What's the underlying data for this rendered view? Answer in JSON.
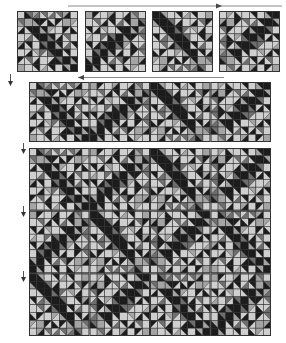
{
  "figure": {
    "colors": {
      "black": "#1c1c1c",
      "dark_gray": "#6e6e6e",
      "mid_gray": "#a4a4a4",
      "light_gray": "#cfcfcf",
      "grid_line": "#2a2a2a",
      "arrow": "#444444"
    },
    "block_grid": 8,
    "base_block": [
      [
        "L",
        "DB",
        "MD",
        "DL",
        "LD",
        "DL",
        "MB",
        "L"
      ],
      [
        "DM",
        "M",
        "BM",
        "BL",
        "LB",
        "BL",
        "M",
        "ML"
      ],
      [
        "LB",
        "BL",
        "B",
        "BM",
        "ML",
        "L",
        "BL",
        "LB"
      ],
      [
        "L",
        "LD",
        "BL",
        "B",
        "BD",
        "LB",
        "DL",
        "L"
      ],
      [
        "MB",
        "BL",
        "L",
        "DB",
        "B",
        "BM",
        "LD",
        "BL"
      ],
      [
        "L",
        "LB",
        "ML",
        "DL",
        "BD",
        "B",
        "BL",
        "L"
      ],
      [
        "BL",
        "DL",
        "LB",
        "L",
        "LB",
        "DB",
        "B",
        "BM"
      ],
      [
        "M",
        "L",
        "BL",
        "LM",
        "BL",
        "L",
        "MB",
        "B"
      ]
    ],
    "top_row": {
      "label": "four rotated blocks",
      "blocks": [
        {
          "id": "block-1",
          "rotation": 0
        },
        {
          "id": "block-2",
          "rotation": 90
        },
        {
          "id": "block-3",
          "rotation": 180
        },
        {
          "id": "block-4",
          "rotation": 270
        }
      ]
    },
    "strip": {
      "label": "joined block strip",
      "cols": 4,
      "rows": 1
    },
    "quilt": {
      "label": "assembled quilt top",
      "cols": 4,
      "rows": 3
    },
    "arrows": [
      {
        "id": "arrow-top-right",
        "direction": "right"
      },
      {
        "id": "arrow-return-left",
        "direction": "left"
      },
      {
        "id": "arrow-down-1",
        "direction": "down"
      },
      {
        "id": "arrow-down-2",
        "direction": "down"
      },
      {
        "id": "arrow-down-3",
        "direction": "down"
      },
      {
        "id": "arrow-down-4",
        "direction": "down"
      }
    ]
  }
}
